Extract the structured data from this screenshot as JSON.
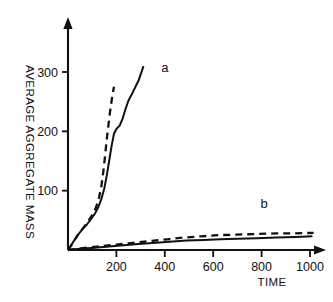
{
  "chart_data": {
    "type": "line",
    "title": "",
    "subtitle": "",
    "xlabel": "TIME",
    "ylabel": "AVERAGE AGGREGATE MASS",
    "xlim": [
      0,
      1060
    ],
    "ylim": [
      0,
      370
    ],
    "xticks": [
      200,
      400,
      600,
      800,
      1000
    ],
    "yticks": [
      100,
      200,
      300
    ],
    "xtick_labels": [
      "200",
      "400",
      "600",
      "800",
      "1000"
    ],
    "ytick_labels": [
      "100",
      "200",
      "300"
    ],
    "grid": false,
    "legend": "inline-annotations",
    "axis_arrows": true,
    "annotations": [
      {
        "text": "a",
        "x": 400,
        "y": 300
      },
      {
        "text": "b",
        "x": 810,
        "y": 70
      }
    ],
    "series": [
      {
        "name": "a",
        "style": "solid",
        "color": "#111111",
        "points": [
          [
            0,
            0
          ],
          [
            10,
            6
          ],
          [
            22,
            14
          ],
          [
            35,
            22
          ],
          [
            50,
            30
          ],
          [
            62,
            36
          ],
          [
            78,
            43
          ],
          [
            95,
            52
          ],
          [
            112,
            62
          ],
          [
            125,
            72
          ],
          [
            138,
            86
          ],
          [
            150,
            104
          ],
          [
            160,
            125
          ],
          [
            170,
            150
          ],
          [
            180,
            175
          ],
          [
            190,
            196
          ],
          [
            200,
            204
          ],
          [
            214,
            210
          ],
          [
            226,
            222
          ],
          [
            238,
            238
          ],
          [
            250,
            252
          ],
          [
            268,
            266
          ],
          [
            292,
            286
          ],
          [
            312,
            310
          ]
        ]
      },
      {
        "name": "a",
        "style": "dashed",
        "color": "#111111",
        "points": [
          [
            0,
            0
          ],
          [
            12,
            7
          ],
          [
            26,
            16
          ],
          [
            40,
            25
          ],
          [
            55,
            33
          ],
          [
            70,
            41
          ],
          [
            86,
            50
          ],
          [
            102,
            60
          ],
          [
            116,
            72
          ],
          [
            128,
            88
          ],
          [
            138,
            108
          ],
          [
            146,
            132
          ],
          [
            153,
            158
          ],
          [
            160,
            186
          ],
          [
            168,
            214
          ],
          [
            176,
            240
          ],
          [
            184,
            262
          ],
          [
            190,
            275
          ]
        ]
      },
      {
        "name": "b",
        "style": "solid",
        "color": "#111111",
        "points": [
          [
            0,
            0
          ],
          [
            50,
            2
          ],
          [
            110,
            4
          ],
          [
            170,
            6
          ],
          [
            230,
            8
          ],
          [
            290,
            10
          ],
          [
            350,
            12
          ],
          [
            420,
            14
          ],
          [
            490,
            16
          ],
          [
            560,
            17
          ],
          [
            630,
            18
          ],
          [
            700,
            19
          ],
          [
            780,
            20
          ],
          [
            860,
            21
          ],
          [
            940,
            22
          ],
          [
            1010,
            23
          ]
        ]
      },
      {
        "name": "b",
        "style": "dashed",
        "color": "#111111",
        "points": [
          [
            0,
            0
          ],
          [
            60,
            3
          ],
          [
            130,
            6
          ],
          [
            200,
            9
          ],
          [
            270,
            12
          ],
          [
            340,
            15
          ],
          [
            410,
            18
          ],
          [
            480,
            21
          ],
          [
            550,
            23
          ],
          [
            620,
            25
          ],
          [
            700,
            26
          ],
          [
            780,
            27
          ],
          [
            860,
            28
          ],
          [
            940,
            28
          ],
          [
            1015,
            29
          ]
        ]
      }
    ]
  }
}
